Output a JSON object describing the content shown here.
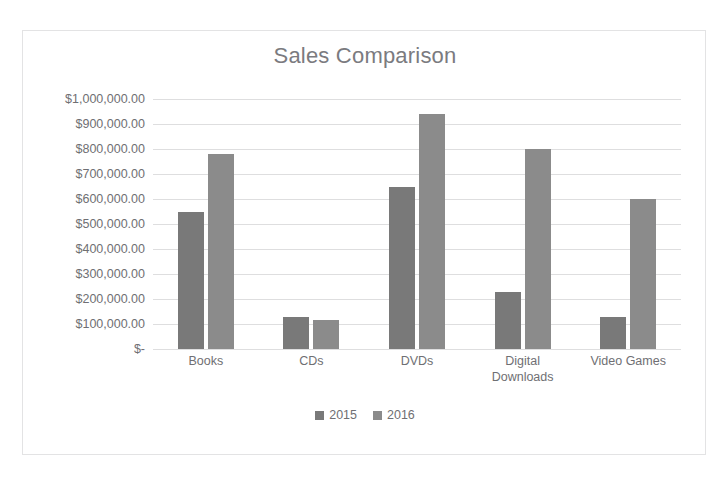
{
  "top_strip": {
    "text": "· · · ·"
  },
  "chart_data": {
    "type": "bar",
    "title": "Sales Comparison",
    "xlabel": "",
    "ylabel": "",
    "categories": [
      "Books",
      "CDs",
      "DVDs",
      "Digital\nDownloads",
      "Video Games"
    ],
    "series": [
      {
        "name": "2015",
        "color": "#797979",
        "values": [
          550000,
          128000,
          650000,
          230000,
          128000
        ]
      },
      {
        "name": "2016",
        "color": "#8b8b8b",
        "values": [
          780000,
          115000,
          940000,
          800000,
          600000
        ]
      }
    ],
    "ylim": [
      0,
      1000000
    ],
    "ytick_values": [
      1000000,
      900000,
      800000,
      700000,
      600000,
      500000,
      400000,
      300000,
      200000,
      100000,
      0
    ],
    "ytick_labels": [
      "$1,000,000.00",
      "$900,000.00",
      "$800,000.00",
      "$700,000.00",
      "$600,000.00",
      "$500,000.00",
      "$400,000.00",
      "$300,000.00",
      "$200,000.00",
      "$100,000.00",
      "$-"
    ],
    "grid": "horizontal",
    "legend_position": "bottom",
    "legend": [
      "2015",
      "2016"
    ]
  }
}
